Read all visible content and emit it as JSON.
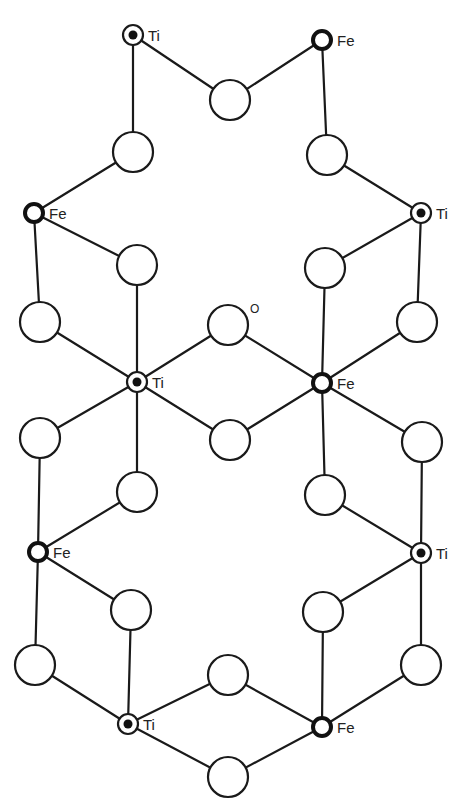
{
  "diagram": {
    "legend": {
      "ti_label": "Ti",
      "fe_label": "Fe",
      "o_label": "O"
    },
    "metals": [
      {
        "id": "m0",
        "type": "Ti",
        "label": "Ti",
        "x": 133,
        "y": 35
      },
      {
        "id": "m1",
        "type": "Fe",
        "label": "Fe",
        "x": 322,
        "y": 40
      },
      {
        "id": "m2",
        "type": "Fe",
        "label": "Fe",
        "x": 34,
        "y": 213
      },
      {
        "id": "m3",
        "type": "Ti",
        "label": "Ti",
        "x": 421,
        "y": 213
      },
      {
        "id": "m4",
        "type": "Ti",
        "label": "Ti",
        "x": 137,
        "y": 382
      },
      {
        "id": "m5",
        "type": "Fe",
        "label": "Fe",
        "x": 322,
        "y": 383
      },
      {
        "id": "m6",
        "type": "Fe",
        "label": "Fe",
        "x": 38,
        "y": 552
      },
      {
        "id": "m7",
        "type": "Ti",
        "label": "Ti",
        "x": 421,
        "y": 553
      },
      {
        "id": "m8",
        "type": "Ti",
        "label": "Ti",
        "x": 128,
        "y": 724
      },
      {
        "id": "m9",
        "type": "Fe",
        "label": "Fe",
        "x": 322,
        "y": 727
      }
    ],
    "oxygens": [
      {
        "id": "o0",
        "x": 230,
        "y": 100
      },
      {
        "id": "o1",
        "x": 133,
        "y": 152
      },
      {
        "id": "o2",
        "x": 327,
        "y": 155
      },
      {
        "id": "o3",
        "x": 137,
        "y": 265
      },
      {
        "id": "o4",
        "x": 325,
        "y": 268
      },
      {
        "id": "o5",
        "x": 40,
        "y": 322
      },
      {
        "id": "o6",
        "x": 228,
        "y": 325,
        "label": "O"
      },
      {
        "id": "o7",
        "x": 417,
        "y": 322
      },
      {
        "id": "o8",
        "x": 40,
        "y": 438
      },
      {
        "id": "o9",
        "x": 230,
        "y": 440
      },
      {
        "id": "o10",
        "x": 422,
        "y": 442
      },
      {
        "id": "o11",
        "x": 137,
        "y": 492
      },
      {
        "id": "o12",
        "x": 325,
        "y": 495
      },
      {
        "id": "o13",
        "x": 131,
        "y": 610
      },
      {
        "id": "o14",
        "x": 323,
        "y": 612
      },
      {
        "id": "o15",
        "x": 35,
        "y": 665
      },
      {
        "id": "o16",
        "x": 228,
        "y": 675
      },
      {
        "id": "o17",
        "x": 421,
        "y": 665
      },
      {
        "id": "o18",
        "x": 228,
        "y": 777
      }
    ],
    "bonds": [
      [
        "m0",
        "o0"
      ],
      [
        "o0",
        "m1"
      ],
      [
        "m0",
        "o1"
      ],
      [
        "o1",
        "m2"
      ],
      [
        "m1",
        "o2"
      ],
      [
        "o2",
        "m3"
      ],
      [
        "m2",
        "o3"
      ],
      [
        "o3",
        "m4"
      ],
      [
        "m2",
        "o5"
      ],
      [
        "o5",
        "m4"
      ],
      [
        "m3",
        "o4"
      ],
      [
        "o4",
        "m5"
      ],
      [
        "m3",
        "o7"
      ],
      [
        "o7",
        "m5"
      ],
      [
        "m4",
        "o6"
      ],
      [
        "o6",
        "m5"
      ],
      [
        "m4",
        "o9"
      ],
      [
        "o9",
        "m5"
      ],
      [
        "m4",
        "o8"
      ],
      [
        "o8",
        "m6"
      ],
      [
        "m4",
        "o11"
      ],
      [
        "o11",
        "m6"
      ],
      [
        "m5",
        "o10"
      ],
      [
        "o10",
        "m7"
      ],
      [
        "m5",
        "o12"
      ],
      [
        "o12",
        "m7"
      ],
      [
        "m6",
        "o13"
      ],
      [
        "o13",
        "m8"
      ],
      [
        "m6",
        "o15"
      ],
      [
        "o15",
        "m8"
      ],
      [
        "m7",
        "o14"
      ],
      [
        "o14",
        "m9"
      ],
      [
        "m7",
        "o17"
      ],
      [
        "o17",
        "m9"
      ],
      [
        "m8",
        "o16"
      ],
      [
        "o16",
        "m9"
      ],
      [
        "m8",
        "o18"
      ],
      [
        "o18",
        "m9"
      ]
    ],
    "style": {
      "line_color": "#1a1a1a",
      "background": "#ffffff",
      "oxygen_radius": 20,
      "metal_radius": 10
    }
  }
}
